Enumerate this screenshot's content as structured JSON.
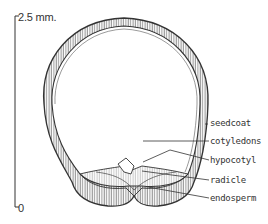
{
  "diagram": {
    "scale": {
      "top_label": "2.5 mm.",
      "bottom_label": "0"
    },
    "labels": [
      {
        "id": "seedcoat",
        "text": "seedcoat"
      },
      {
        "id": "cotyledons",
        "text": "cotyledons"
      },
      {
        "id": "hypocotyl",
        "text": "hypocotyl"
      },
      {
        "id": "radicle",
        "text": "radicle"
      },
      {
        "id": "endosperm",
        "text": "endosperm"
      }
    ],
    "colors": {
      "ink": "#333333",
      "background": "#ffffff"
    }
  }
}
